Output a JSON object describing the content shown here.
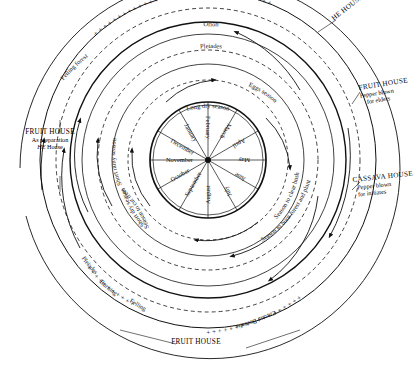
{
  "diagram": {
    "colors": {
      "ink": "#111111",
      "paper": "#ffffff"
    }
  },
  "months": [
    "February",
    "March",
    "April",
    "May",
    "June",
    "July",
    "August",
    "September",
    "October",
    "November",
    "December",
    "January"
  ],
  "seasons": [
    {
      "id": "long-dry",
      "label": "Long dry season"
    },
    {
      "id": "short-rainy",
      "label": "Short rainy season"
    },
    {
      "id": "short-dry",
      "label": "Short dry season"
    },
    {
      "id": "long-rainy",
      "label": "Long rainy season"
    },
    {
      "id": "eggs",
      "label": "Eggs season"
    }
  ],
  "ring_labels": [
    {
      "id": "season-clear-bush",
      "label": "Season to clear bush"
    },
    {
      "id": "season-burn-plant",
      "label": "Season to burn forest and plant"
    },
    {
      "id": "season-cut-trees",
      "label": "Season to cut trees"
    }
  ],
  "stars": [
    {
      "id": "pleiades-top",
      "label": "Pleiades"
    },
    {
      "id": "orion-top",
      "label": "Orion"
    },
    {
      "id": "pleiades-bottom",
      "label": "Pleiades"
    },
    {
      "id": "corona-borealis",
      "label": "Corona Borealis"
    }
  ],
  "activities": [
    {
      "id": "burning-top",
      "label": "Burning"
    },
    {
      "id": "felling-top",
      "label": "Felling forest"
    },
    {
      "id": "burning-bottom",
      "label": "Burning"
    },
    {
      "id": "felling-bottom",
      "label": "Felling"
    }
  ],
  "callouts": [
    {
      "id": "fruit-house-left",
      "title": "FRUIT HOUSE",
      "line1": "As preparation",
      "line2": "for HE House",
      "emph": "HE"
    },
    {
      "id": "fruit-house-right",
      "title": "FRUIT HOUSE",
      "line1": "Pepper blown",
      "line2": "for elders"
    },
    {
      "id": "cassava-house-right",
      "title": "CASSAVA HOUSE",
      "line1": "Pepper blown",
      "line2": "for initiates"
    },
    {
      "id": "he-house-top",
      "title": "HE HOUSE"
    },
    {
      "id": "fruit-house-bottom",
      "title": "FRUIT HOUSE"
    }
  ]
}
